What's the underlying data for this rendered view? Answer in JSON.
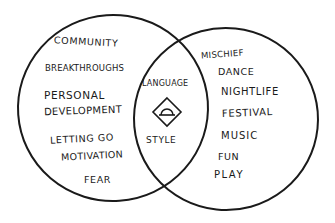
{
  "diagram": {
    "type": "venn",
    "left_set": {
      "items": [
        "COMMUNITY",
        "BREAKTHROUGHS",
        "PERSONAL",
        "DEVELOPMENT",
        "LETTING GO",
        "MOTIVATION",
        "FEAR"
      ]
    },
    "right_set": {
      "items": [
        "MISCHIEF",
        "DANCE",
        "NIGHTLIFE",
        "FESTIVAL",
        "MUSIC",
        "FUN",
        "PLAY"
      ]
    },
    "intersection": {
      "top_label": "LANGUAGE",
      "bottom_label": "STYLE",
      "icon": "diamond-with-dome-icon"
    },
    "colors": {
      "ink": "#1a1a1a",
      "background": "#ffffff"
    }
  }
}
